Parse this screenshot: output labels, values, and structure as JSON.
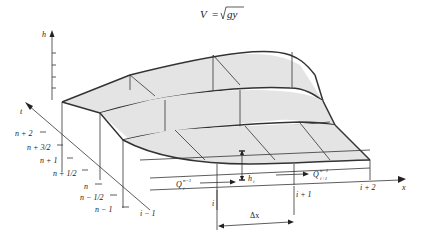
{
  "title": {
    "equation": "V = √gy",
    "lhs": "V",
    "rhs_var": "gy"
  },
  "axes": {
    "vertical": "h",
    "depth": "t",
    "horizontal": "x"
  },
  "time_levels": [
    "n + 2",
    "n + 3/2",
    "n + 1",
    "n + 1/2",
    "n",
    "n − 1/2",
    "n − 1"
  ],
  "space_nodes": [
    "i − 1",
    "i",
    "i + 1",
    "i + 2"
  ],
  "annotations": {
    "flux_left": "Q",
    "flux_left_sup": "n−1",
    "flux_left_sub": "i",
    "flux_right": "Q",
    "flux_right_sup": "n−1",
    "flux_right_sub": "i+1",
    "depth": "h",
    "depth_sub": "i",
    "spacing": "Δx"
  },
  "colors": {
    "line": "#333333",
    "shade": "#e4e4e4",
    "background": "#ffffff"
  }
}
